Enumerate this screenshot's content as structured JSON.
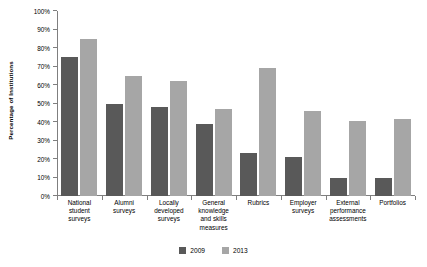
{
  "chart_data": {
    "type": "bar",
    "title": "",
    "subtitle": "",
    "xlabel": "",
    "ylabel": "Percentage of Institutions",
    "ylim": [
      0,
      100
    ],
    "grid": false,
    "legend_position": "bottom",
    "y_ticks": [
      "0%",
      "10%",
      "20%",
      "30%",
      "40%",
      "50%",
      "60%",
      "70%",
      "80%",
      "90%",
      "100%"
    ],
    "y_tick_values": [
      0,
      10,
      20,
      30,
      40,
      50,
      60,
      70,
      80,
      90,
      100
    ],
    "categories": [
      "National student surveys",
      "Alumni surveys",
      "Locally developed surveys",
      "General knowledge and skills measures",
      "Rubrics",
      "Employer surveys",
      "External performance assessments",
      "Portfolios"
    ],
    "category_lines": [
      [
        "National",
        "student",
        "surveys"
      ],
      [
        "Alumni",
        "surveys"
      ],
      [
        "Locally",
        "developed",
        "surveys"
      ],
      [
        "General",
        "knowledge",
        "and skills",
        "measures"
      ],
      [
        "Rubrics"
      ],
      [
        "Employer",
        "surveys"
      ],
      [
        "External",
        "performance",
        "assessments"
      ],
      [
        "Portfolios"
      ]
    ],
    "series": [
      {
        "name": "2009",
        "color": "#595959",
        "values": [
          75,
          50,
          48,
          39,
          23,
          21,
          9.5,
          9.5
        ]
      },
      {
        "name": "2013",
        "color": "#a6a6a6",
        "values": [
          85,
          65,
          62,
          47,
          69,
          46,
          40.5,
          41.5
        ]
      }
    ]
  }
}
